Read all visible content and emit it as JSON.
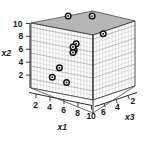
{
  "chart_data": {
    "type": "scatter",
    "title": "",
    "subtitle": "",
    "projection": "3d",
    "xlabel": "x1",
    "ylabel": "x2",
    "zlabel": "x3",
    "xlim": [
      1,
      11
    ],
    "ylim": [
      1,
      11
    ],
    "zlim": [
      1,
      7
    ],
    "xticks": [
      2,
      4,
      6,
      8,
      10
    ],
    "yticks": [
      2,
      4,
      6,
      8,
      10
    ],
    "zticks": [
      6,
      4,
      2
    ],
    "xtick_labels": [
      "2",
      "4",
      "6",
      "8",
      "10"
    ],
    "ytick_labels": [
      "10",
      "8",
      "6",
      "4",
      "2"
    ],
    "ztick_labels": [
      "6",
      "4",
      "2"
    ],
    "grid": true,
    "grid_panes": [
      "back-left-wall",
      "back-right-wall",
      "ceiling"
    ],
    "ceiling_shaded": true,
    "floor_shaded": false,
    "legend": false,
    "legend_position": "none",
    "marker_style": "bullseye",
    "marker_color": "#111111",
    "points": [
      {
        "x1": 5.2,
        "x2": 10.0,
        "x3": 4.6
      },
      {
        "x1": 7.6,
        "x2": 10.0,
        "x3": 3.3
      },
      {
        "x1": 5.0,
        "x2": 7.0,
        "x3": 6.0
      },
      {
        "x1": 7.1,
        "x2": 6.2,
        "x3": 4.0
      },
      {
        "x1": 7.3,
        "x2": 5.4,
        "x3": 3.9
      },
      {
        "x1": 7.4,
        "x2": 5.1,
        "x3": 3.8
      },
      {
        "x1": 8.9,
        "x2": 3.0,
        "x3": 3.2
      },
      {
        "x1": 9.6,
        "x2": 1.8,
        "x3": 2.8
      },
      {
        "x1": 8.2,
        "x2": 1.1,
        "x3": 3.6
      },
      {
        "x1": 7.5,
        "x2": 5.7,
        "x3": 3.9
      }
    ],
    "n_points": 10,
    "colors": {
      "marker": "#111111",
      "ceiling_pane": "#a8a8a8",
      "grid_line": "#b9b9b9",
      "frame": "#3a3a3a",
      "text": "#1a1a1a",
      "background": "#ffffff"
    }
  },
  "axes": {
    "x1": {
      "label": "x1",
      "ticks": [
        "2",
        "4",
        "6",
        "8",
        "10"
      ]
    },
    "x2": {
      "label": "x2",
      "ticks": [
        "10",
        "8",
        "6",
        "4",
        "2"
      ]
    },
    "x3": {
      "label": "x3",
      "ticks": [
        "6",
        "4",
        "2"
      ]
    }
  }
}
